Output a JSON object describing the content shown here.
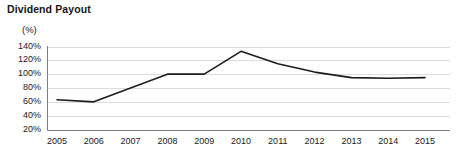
{
  "chart_data": {
    "type": "line",
    "title": "Dividend Payout",
    "ylabel": "(%)",
    "xlabel": "",
    "categories": [
      "2005",
      "2006",
      "2007",
      "2008",
      "2009",
      "2010",
      "2011",
      "2012",
      "2013",
      "2014",
      "2015"
    ],
    "values": [
      63,
      60,
      80,
      100,
      100,
      133,
      115,
      103,
      95,
      94,
      95
    ],
    "series": [
      {
        "name": "Dividend Payout",
        "values": [
          63,
          60,
          80,
          100,
          100,
          133,
          115,
          103,
          95,
          94,
          95
        ]
      }
    ],
    "ylim": [
      20,
      140
    ],
    "y_ticks": [
      20,
      40,
      60,
      80,
      100,
      120,
      140
    ],
    "y_tick_labels": [
      "20%",
      "40%",
      "60%",
      "80%",
      "100%",
      "120%",
      "140%"
    ],
    "grid": true,
    "grid_axis": "y",
    "legend": false,
    "legend_position": "none",
    "line_color": "#1c1c1c",
    "grid_color": "#dcdcdc",
    "axis_color": "#808080",
    "background_color": "#ffffff"
  }
}
